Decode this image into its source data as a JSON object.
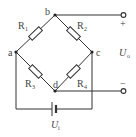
{
  "diagram": {
    "type": "wheatstone-bridge",
    "nodes": {
      "a": "a",
      "b": "b",
      "c": "c",
      "d": "d"
    },
    "resistors": [
      {
        "id": "R1",
        "label": "R",
        "sub": "1",
        "between": [
          "a",
          "b"
        ]
      },
      {
        "id": "R2",
        "label": "R",
        "sub": "2",
        "between": [
          "b",
          "c"
        ]
      },
      {
        "id": "R3",
        "label": "R",
        "sub": "3",
        "between": [
          "a",
          "d"
        ]
      },
      {
        "id": "R4",
        "label": "R",
        "sub": "4",
        "between": [
          "d",
          "c"
        ]
      }
    ],
    "output": {
      "label": "U",
      "sub": "o",
      "plus": "+",
      "minus": "−"
    },
    "input": {
      "label": "U",
      "sub": "i"
    }
  }
}
